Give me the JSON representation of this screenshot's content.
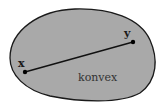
{
  "diagram": {
    "title": "",
    "set_label": "konvex",
    "points": [
      {
        "label": "x",
        "cx": 25,
        "cy": 72
      },
      {
        "label": "y",
        "cx": 133,
        "cy": 42
      }
    ],
    "colors": {
      "fill": "#a9a9a9",
      "outline": "#1a1a1a",
      "segment": "#111111",
      "background": "#ffffff"
    }
  }
}
